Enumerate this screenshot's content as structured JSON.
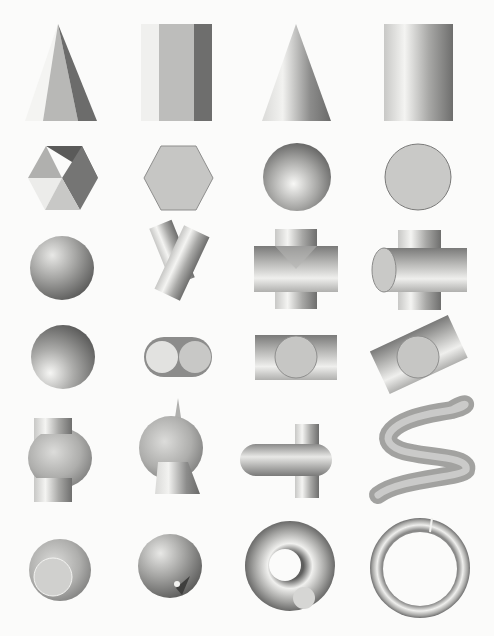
{
  "plate": {
    "layout": {
      "rows": 6,
      "columns": 4
    },
    "colors": {
      "background": "#fbfbfa",
      "light": "#f2f2f0",
      "mid": "#b9b9b7",
      "dark": "#5e5e5e",
      "face": "#cfcfcd"
    },
    "figures": [
      {
        "row": 1,
        "col": 1,
        "name": "pyramid"
      },
      {
        "row": 1,
        "col": 2,
        "name": "prism"
      },
      {
        "row": 1,
        "col": 3,
        "name": "cone"
      },
      {
        "row": 1,
        "col": 4,
        "name": "cylinder"
      },
      {
        "row": 2,
        "col": 1,
        "name": "pyramid-top-view"
      },
      {
        "row": 2,
        "col": 2,
        "name": "prism-top-view"
      },
      {
        "row": 2,
        "col": 3,
        "name": "cone-top-view"
      },
      {
        "row": 2,
        "col": 4,
        "name": "cylinder-top-view"
      },
      {
        "row": 3,
        "col": 1,
        "name": "sphere"
      },
      {
        "row": 3,
        "col": 2,
        "name": "crossed-cylinders"
      },
      {
        "row": 3,
        "col": 3,
        "name": "cylinder-cross"
      },
      {
        "row": 3,
        "col": 4,
        "name": "cylinder-cross-end-view"
      },
      {
        "row": 4,
        "col": 1,
        "name": "sphere-lit-below"
      },
      {
        "row": 4,
        "col": 2,
        "name": "twin-cylinder-end-view"
      },
      {
        "row": 4,
        "col": 3,
        "name": "cylinder-with-end-disc"
      },
      {
        "row": 4,
        "col": 4,
        "name": "tilted-cylinder-with-end-disc"
      },
      {
        "row": 5,
        "col": 1,
        "name": "sphere-pierced-by-cylinder"
      },
      {
        "row": 5,
        "col": 2,
        "name": "sphere-on-cone-with-spike"
      },
      {
        "row": 5,
        "col": 3,
        "name": "capsule-through-rod"
      },
      {
        "row": 5,
        "col": 4,
        "name": "serpentine-tube"
      },
      {
        "row": 6,
        "col": 1,
        "name": "sphere-with-cylinder-end"
      },
      {
        "row": 6,
        "col": 2,
        "name": "sphere-with-cone-hole"
      },
      {
        "row": 6,
        "col": 3,
        "name": "torus-with-cut"
      },
      {
        "row": 6,
        "col": 4,
        "name": "ring"
      }
    ]
  }
}
